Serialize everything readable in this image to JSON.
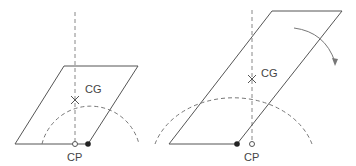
{
  "left": {
    "cg_label": "CG",
    "cp_label": "CP"
  },
  "right": {
    "cg_label": "CG",
    "cp_label": "CP"
  },
  "colors": {
    "line": "#555555",
    "dash": "#777777"
  }
}
